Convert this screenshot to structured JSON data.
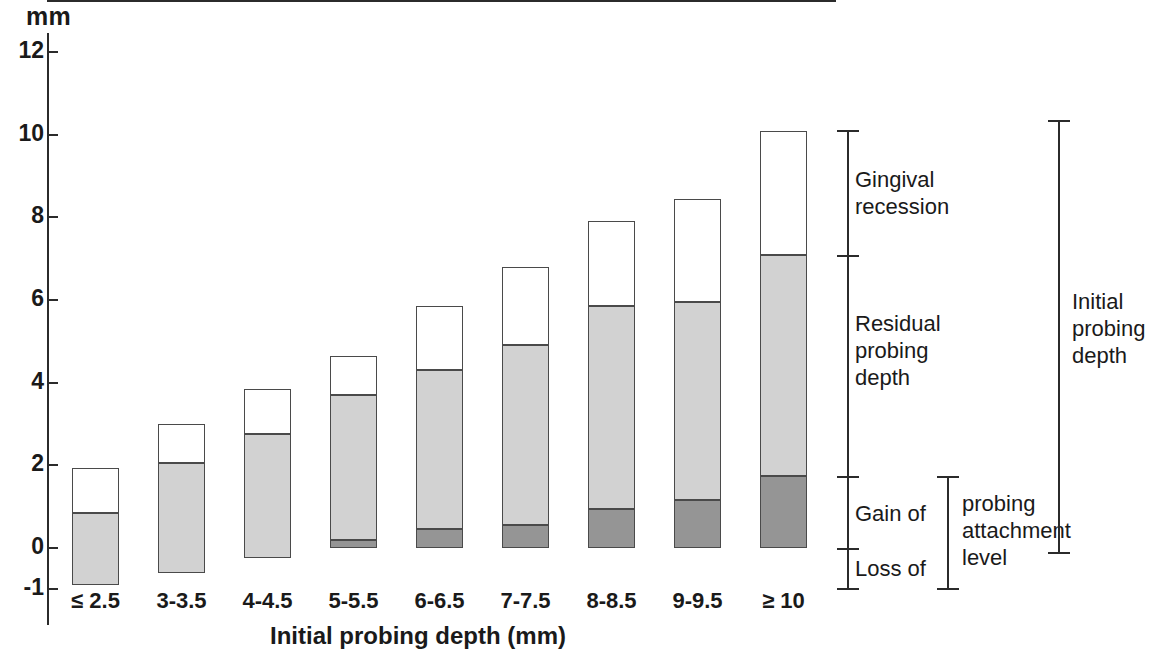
{
  "figure": {
    "unit_label": "mm",
    "x_axis_title": "Initial probing depth (mm)"
  },
  "y_axis": {
    "ticks": [
      12,
      10,
      8,
      6,
      4,
      2,
      0,
      -1
    ],
    "tick_labels": [
      "12",
      "10",
      "8",
      "6",
      "4",
      "2",
      "0",
      "-1"
    ],
    "min": -1.2,
    "max": 12.4
  },
  "annotations": {
    "gingival_recession": "Gingival\nrecession",
    "residual_probing_depth": "Residual\nprobing\ndepth",
    "gain_of": "Gain of",
    "loss_of": "Loss of",
    "probing_attachment_level": "probing\nattachment\nlevel",
    "initial_probing_depth": "Initial\nprobing\ndepth"
  },
  "colors": {
    "gingival_recession": "#ffffff",
    "residual_probing_depth": "#d2d2d2",
    "probing_attachment_level": "#959595",
    "outline": "#4a4a4a",
    "axis": "#2b2b2b"
  },
  "chart_data": {
    "type": "bar",
    "title": "",
    "subtitle": "",
    "xlabel": "Initial probing depth (mm)",
    "ylabel": "mm",
    "ylim": [
      -1.2,
      12.4
    ],
    "yticks": [
      -1,
      0,
      2,
      4,
      6,
      8,
      10,
      12
    ],
    "grid": false,
    "legend": "none",
    "stacked": true,
    "baseline": 0,
    "categories": [
      "≤ 2.5",
      "3-3.5",
      "4-4.5",
      "5-5.5",
      "6-6.5",
      "7-7.5",
      "8-8.5",
      "9-9.5",
      "≥ 10"
    ],
    "series": [
      {
        "name": "Probing attachment level change",
        "note": "below zero = loss of attachment, above zero = gain of attachment",
        "color": "#959595",
        "segment_from": [
          -0.9,
          -0.6,
          -0.25,
          0.2,
          0.45,
          0.55,
          0.95,
          1.15,
          1.75
        ],
        "segment_to": [
          0.0,
          0.0,
          0.0,
          0.0,
          0.0,
          0.0,
          0.0,
          0.0,
          0.0
        ],
        "values": [
          -0.9,
          -0.6,
          -0.25,
          0.2,
          0.45,
          0.55,
          0.95,
          1.15,
          1.75
        ]
      },
      {
        "name": "Residual probing depth",
        "color": "#d2d2d2",
        "segment_from": [
          -0.9,
          -0.6,
          -0.25,
          0.2,
          0.45,
          0.55,
          0.95,
          1.15,
          1.75
        ],
        "segment_to": [
          0.85,
          2.05,
          2.75,
          3.7,
          4.3,
          4.9,
          5.85,
          5.95,
          7.1
        ],
        "values": [
          1.75,
          2.65,
          3.0,
          3.5,
          3.85,
          4.35,
          4.9,
          4.8,
          5.35
        ]
      },
      {
        "name": "Gingival recession",
        "color": "#ffffff",
        "segment_from": [
          0.85,
          2.05,
          2.75,
          3.7,
          4.3,
          4.9,
          5.85,
          5.95,
          7.1
        ],
        "segment_to": [
          1.93,
          3.0,
          3.85,
          4.65,
          5.85,
          6.8,
          7.9,
          8.45,
          10.1
        ],
        "values": [
          1.08,
          0.95,
          1.1,
          0.95,
          1.55,
          1.9,
          2.05,
          2.5,
          3.0
        ]
      }
    ],
    "bar_tops": [
      1.93,
      3.0,
      3.85,
      4.65,
      5.85,
      6.8,
      7.9,
      8.45,
      10.1
    ],
    "bar_bottoms": [
      -0.9,
      -0.6,
      -0.25,
      0.2,
      0.45,
      0.55,
      0.95,
      1.15,
      1.75
    ]
  },
  "bracket_values": {
    "gingival_recession_range": [
      7.1,
      10.1
    ],
    "residual_probing_depth_range": [
      1.75,
      7.1
    ],
    "gain_of_range": [
      0.0,
      1.75
    ],
    "loss_of_range": [
      -1.0,
      0.0
    ],
    "probing_attachment_level_range": [
      -1.0,
      1.75
    ],
    "initial_probing_depth_range": [
      -0.1,
      10.35
    ]
  }
}
